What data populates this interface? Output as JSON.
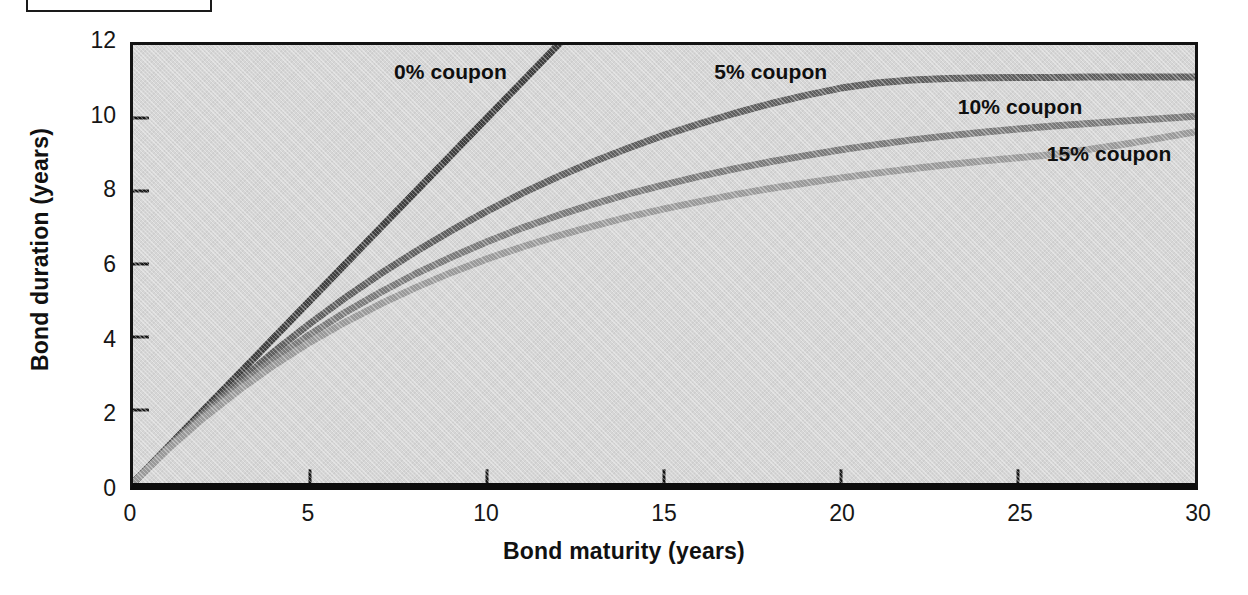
{
  "figure": {
    "caption_box": {
      "text": "",
      "visible": true
    }
  },
  "axes": {
    "x": {
      "label": "Bond maturity (years)",
      "ticks": [
        "0",
        "5",
        "10",
        "15",
        "20",
        "25",
        "30"
      ],
      "min": 0,
      "max": 30
    },
    "y": {
      "label": "Bond duration (years)",
      "ticks": [
        "0",
        "2",
        "4",
        "6",
        "8",
        "10",
        "12"
      ],
      "min": 0,
      "max": 12
    }
  },
  "annotations": [
    {
      "text": "0% coupon",
      "x_value": 9.0,
      "y_value": 11.15
    },
    {
      "text": "5% coupon",
      "x_value": 18.0,
      "y_value": 11.15
    },
    {
      "text": "10% coupon",
      "x_value": 25.0,
      "y_value": 10.2
    },
    {
      "text": "15% coupon",
      "x_value": 27.5,
      "y_value": 8.95
    }
  ],
  "colors": {
    "plot_background": "#d6d6d6",
    "page_background": "#ffffff",
    "axis": "#131313",
    "coupon_0": "#3d3d3d",
    "coupon_5": "#5e5e5e",
    "coupon_10": "#7a7a7a",
    "coupon_15": "#9a9a9a",
    "text": "#111111"
  },
  "chart_data": {
    "type": "line",
    "title": "",
    "xlabel": "Bond maturity (years)",
    "ylabel": "Bond duration (years)",
    "xlim": [
      0,
      30
    ],
    "ylim": [
      0,
      12
    ],
    "grid": false,
    "legend_position": "inline-annotations",
    "x": [
      0,
      1,
      2,
      3,
      4,
      5,
      6,
      7,
      8,
      9,
      10,
      11,
      12,
      13,
      14,
      15,
      16,
      17,
      18,
      19,
      20,
      21,
      22,
      23,
      24,
      25,
      26,
      27,
      28,
      29,
      30
    ],
    "series": [
      {
        "name": "0% coupon",
        "color": "#3d3d3d",
        "note": "Zero-coupon bond: duration equals maturity; line exits top of plot at maturity 12.",
        "values": [
          0,
          1,
          2,
          3,
          4,
          5,
          6,
          7,
          8,
          9,
          10,
          11,
          12,
          13,
          14,
          15,
          16,
          17,
          18,
          19,
          20,
          21,
          22,
          23,
          24,
          25,
          26,
          27,
          28,
          29,
          30
        ]
      },
      {
        "name": "5% coupon",
        "color": "#5e5e5e",
        "values": [
          0,
          0.98,
          1.92,
          2.79,
          3.61,
          4.37,
          5.08,
          5.74,
          6.35,
          6.92,
          7.45,
          7.94,
          8.39,
          8.8,
          9.18,
          9.53,
          9.84,
          10.13,
          10.39,
          10.62,
          10.82,
          10.96,
          11.04,
          11.08,
          11.1,
          11.11,
          11.11,
          11.12,
          11.12,
          11.12,
          11.12
        ]
      },
      {
        "name": "10% coupon",
        "color": "#7a7a7a",
        "values": [
          0,
          0.96,
          1.85,
          2.66,
          3.4,
          4.07,
          4.68,
          5.23,
          5.74,
          6.19,
          6.61,
          6.99,
          7.33,
          7.64,
          7.92,
          8.17,
          8.4,
          8.61,
          8.8,
          8.97,
          9.13,
          9.27,
          9.4,
          9.51,
          9.61,
          9.7,
          9.78,
          9.85,
          9.92,
          9.98,
          10.05
        ]
      },
      {
        "name": "15% coupon",
        "color": "#9a9a9a",
        "values": [
          0,
          0.94,
          1.79,
          2.55,
          3.24,
          3.86,
          4.41,
          4.91,
          5.36,
          5.77,
          6.14,
          6.47,
          6.77,
          7.04,
          7.29,
          7.51,
          7.71,
          7.9,
          8.07,
          8.22,
          8.36,
          8.49,
          8.61,
          8.72,
          8.82,
          8.91,
          9.0,
          9.14,
          9.28,
          9.45,
          9.62
        ]
      }
    ]
  }
}
